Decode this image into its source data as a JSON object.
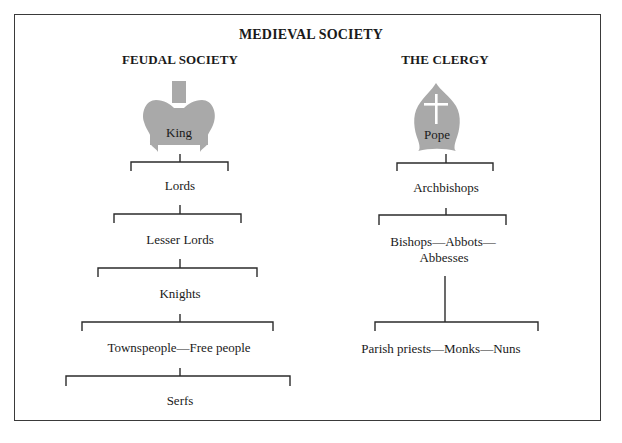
{
  "title": "MEDIEVAL SOCIETY",
  "colors": {
    "icon_fill": "#a9a9a9",
    "line": "#2b2b2b",
    "frame": "#3a3a3a",
    "cross": "#ffffff"
  },
  "feudal": {
    "heading": "FEUDAL SOCIETY",
    "icon": "crown-icon",
    "levels": [
      "King",
      "Lords",
      "Lesser Lords",
      "Knights",
      "Townspeople—Free people",
      "Serfs"
    ]
  },
  "clergy": {
    "heading": "THE CLERGY",
    "icon": "mitre-icon",
    "levels": [
      "Pope",
      "Archbishops",
      "Bishops—Abbots—",
      "Abbesses",
      "Parish priests—Monks—Nuns"
    ]
  }
}
